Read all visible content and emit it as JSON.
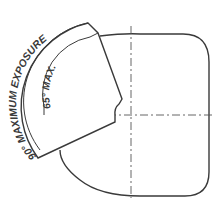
{
  "diagram": {
    "outer_label": "90° MAXIMUM EXPOSURE",
    "inner_label": "65° MAX.",
    "stroke_color": "#3a3a3a"
  }
}
